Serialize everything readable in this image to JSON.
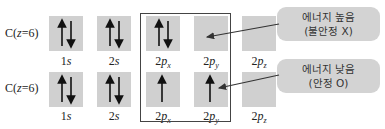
{
  "rows": [
    {
      "atom": {
        "prefix": "C(",
        "var": "z",
        "suffix": "=6)"
      },
      "orbitals": [
        {
          "n": "1",
          "l": "s",
          "sub": "",
          "electrons": [
            "up",
            "down"
          ]
        },
        {
          "n": "2",
          "l": "s",
          "sub": "",
          "electrons": [
            "up",
            "down"
          ]
        },
        {
          "n": "2",
          "l": "p",
          "sub": "x",
          "electrons": [
            "up",
            "down"
          ]
        },
        {
          "n": "2",
          "l": "p",
          "sub": "y",
          "electrons": []
        },
        {
          "n": "2",
          "l": "p",
          "sub": "z",
          "electrons": []
        }
      ],
      "callout": {
        "line1": "에너지 높음",
        "line2": "(불안정 X)"
      }
    },
    {
      "atom": {
        "prefix": "C(",
        "var": "z",
        "suffix": "=6)"
      },
      "orbitals": [
        {
          "n": "1",
          "l": "s",
          "sub": "",
          "electrons": [
            "up",
            "down"
          ]
        },
        {
          "n": "2",
          "l": "s",
          "sub": "",
          "electrons": [
            "up",
            "down"
          ]
        },
        {
          "n": "2",
          "l": "p",
          "sub": "x",
          "electrons": [
            "up"
          ]
        },
        {
          "n": "2",
          "l": "p",
          "sub": "y",
          "electrons": [
            "up"
          ]
        },
        {
          "n": "2",
          "l": "p",
          "sub": "z",
          "electrons": []
        }
      ],
      "callout": {
        "line1": "에너지 낮음",
        "line2": "(안정 O)"
      }
    }
  ],
  "colors": {
    "orbital_box": "#d0d0d0",
    "bubble": "#d3d3d3",
    "frame": "#444444",
    "arrow": "#222222"
  }
}
